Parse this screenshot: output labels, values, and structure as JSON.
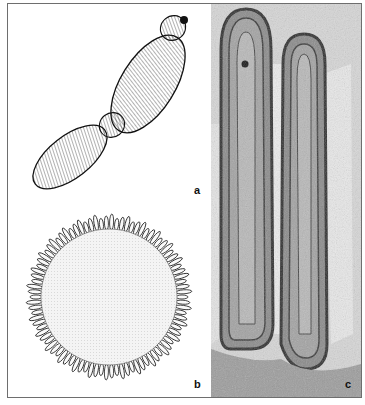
{
  "figure": {
    "panels": [
      {
        "id": "a",
        "label": "a",
        "description": "line drawing of elongated segmented body with striations"
      },
      {
        "id": "b",
        "label": "b",
        "description": "circular cross-section with fringe of finger-like projections"
      },
      {
        "id": "c",
        "label": "c",
        "description": "electron micrograph of two elongated projections"
      }
    ]
  },
  "colors": {
    "frame": "#6e6e6e",
    "ink": "#1a1a1a",
    "stipple": "#e6e6e6",
    "micrograph_bg": "#cfcfcf",
    "micrograph_dark": "#3a3a3a"
  }
}
